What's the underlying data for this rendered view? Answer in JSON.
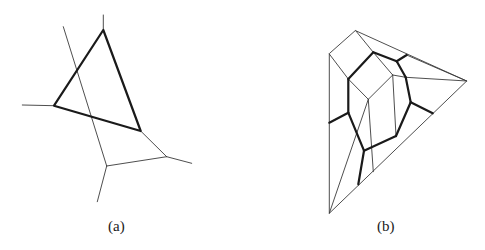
{
  "figure": {
    "panels": [
      {
        "id": "a",
        "label": "(a)",
        "thick_polygon": [
          [
            103.3,
            30
          ],
          [
            54,
            105.7
          ],
          [
            140.7,
            131
          ]
        ],
        "thin_segments": [
          [
            [
              103.3,
              30
            ],
            [
              103.3,
              15
            ]
          ],
          [
            [
              54,
              105.7
            ],
            [
              22.3,
              105
            ]
          ],
          [
            [
              63.3,
              26.7
            ],
            [
              106.7,
              166
            ]
          ],
          [
            [
              140.7,
              131
            ],
            [
              166.7,
              156.7
            ]
          ],
          [
            [
              106.7,
              166
            ],
            [
              166.7,
              156.7
            ]
          ],
          [
            [
              166.7,
              156.7
            ],
            [
              191.7,
              163.3
            ]
          ],
          [
            [
              106.7,
              166
            ],
            [
              97.3,
              201.7
            ]
          ]
        ]
      },
      {
        "id": "b",
        "label": "(b)",
        "outer_boundary": [
          [
            355.7,
            30.7
          ],
          [
            466.7,
            81
          ],
          [
            329.3,
            213.3
          ],
          [
            329.3,
            54
          ]
        ],
        "thin_segments": [
          [
            [
              355.7,
              30.7
            ],
            [
              373.3,
              52.3
            ]
          ],
          [
            [
              329.3,
              54
            ],
            [
              348.3,
              79
            ]
          ],
          [
            [
              348.3,
              79
            ],
            [
              368.3,
              99.3
            ]
          ],
          [
            [
              373.3,
              52.3
            ],
            [
              392.7,
              75
            ]
          ],
          [
            [
              392.7,
              75
            ],
            [
              368.3,
              99.3
            ]
          ],
          [
            [
              392.7,
              75
            ],
            [
              405.7,
              77.3
            ]
          ],
          [
            [
              405.7,
              77.3
            ],
            [
              466.7,
              81
            ]
          ],
          [
            [
              406.7,
              55
            ],
            [
              466.7,
              81
            ]
          ],
          [
            [
              392.7,
              75
            ],
            [
              396,
              136
            ]
          ],
          [
            [
              368.3,
              99.3
            ],
            [
              373.3,
              171.7
            ]
          ],
          [
            [
              368.3,
              99.3
            ],
            [
              329.3,
              213.3
            ]
          ],
          [
            [
              396,
              136
            ],
            [
              396,
              136
            ]
          ]
        ],
        "thick_segments": [
          [
            [
              373.3,
              52.3
            ],
            [
              348.3,
              79
            ]
          ],
          [
            [
              348.3,
              79
            ],
            [
              348.3,
              112.7
            ]
          ],
          [
            [
              348.3,
              112.7
            ],
            [
              329.3,
              122.7
            ]
          ],
          [
            [
              348.3,
              112.7
            ],
            [
              364,
              150.7
            ]
          ],
          [
            [
              364,
              150.7
            ],
            [
              396,
              136
            ]
          ],
          [
            [
              396,
              136
            ],
            [
              410.7,
              102.3
            ]
          ],
          [
            [
              410.7,
              102.3
            ],
            [
              432.7,
              113.3
            ]
          ],
          [
            [
              410.7,
              102.3
            ],
            [
              405.7,
              77.3
            ]
          ],
          [
            [
              405.7,
              77.3
            ],
            [
              396.7,
              61.3
            ]
          ],
          [
            [
              396.7,
              61.3
            ],
            [
              373.3,
              52.3
            ]
          ],
          [
            [
              396.7,
              61.3
            ],
            [
              406.7,
              55
            ]
          ],
          [
            [
              364,
              150.7
            ],
            [
              358.3,
              184.3
            ]
          ]
        ]
      }
    ]
  }
}
